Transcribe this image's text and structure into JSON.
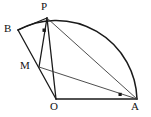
{
  "figure": {
    "background_color": "#ffffff",
    "stroke_color": "#1a1a1a",
    "width": 151,
    "height": 117,
    "labels": {
      "P": "P",
      "B": "B",
      "M": "M",
      "O": "O",
      "A": "A"
    },
    "points": {
      "P": {
        "x": 47,
        "y": 18
      },
      "B": {
        "x": 18,
        "y": 30
      },
      "M": {
        "x": 39,
        "y": 67
      },
      "O": {
        "x": 56,
        "y": 99
      },
      "A": {
        "x": 137,
        "y": 99
      }
    },
    "label_positions": {
      "P": {
        "x": 41,
        "y": 2
      },
      "B": {
        "x": 5,
        "y": 24
      },
      "M": {
        "x": 21,
        "y": 60
      },
      "O": {
        "x": 50,
        "y": 100
      },
      "A": {
        "x": 131,
        "y": 101
      }
    },
    "arc": {
      "center": "O",
      "radius": 81,
      "from": "B",
      "through": "P",
      "to": "A"
    },
    "segments": [
      {
        "from": "O",
        "to": "A",
        "name": "segment-OA"
      },
      {
        "from": "B",
        "to": "O",
        "name": "segment-BO"
      },
      {
        "from": "P",
        "to": "B",
        "name": "segment-PB"
      },
      {
        "from": "P",
        "to": "M",
        "name": "segment-PM"
      },
      {
        "from": "P",
        "to": "O",
        "name": "segment-PO"
      },
      {
        "from": "P",
        "to": "A",
        "name": "segment-PA"
      },
      {
        "from": "M",
        "to": "A",
        "name": "segment-MA"
      }
    ],
    "right_angle_marks": [
      {
        "at": {
          "x": 44,
          "y": 30
        },
        "name": "right-angle-at-M-on-PM"
      },
      {
        "at": {
          "x": 120,
          "y": 94
        },
        "name": "right-angle-at-A"
      }
    ]
  }
}
